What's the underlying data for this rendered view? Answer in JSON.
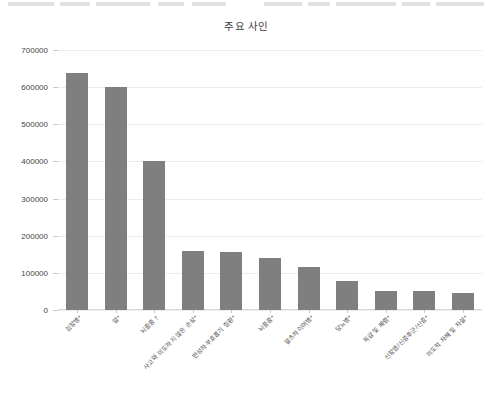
{
  "chart_data": {
    "type": "bar",
    "title": "주요 사인",
    "xlabel": "",
    "ylabel": "",
    "ylim": [
      0,
      700000
    ],
    "ytick_values": [
      0,
      100000,
      200000,
      300000,
      400000,
      500000,
      600000,
      700000
    ],
    "ytick_labels": [
      "0",
      "100000",
      "200000",
      "300000",
      "400000",
      "500000",
      "600000",
      "700000"
    ],
    "grid": true,
    "legend": "none",
    "bar_color": "#7f7f7f",
    "categories": [
      "심장병*",
      "암*",
      "뇌졸중 †",
      "사고와 의도하지 않은 손상*",
      "만성하부호흡기 질환*",
      "뇌졸중*",
      "알츠하이머병*",
      "당뇨병*",
      "독감 및 폐렴*",
      "신장염/신증후군/신증*",
      "의도적 자해 및 자살*"
    ],
    "values": [
      638000,
      600000,
      400000,
      160000,
      155000,
      140000,
      115000,
      79000,
      52000,
      50000,
      45000
    ]
  },
  "figure": {
    "background": "#ffffff",
    "axis_color": "#d8d8d8",
    "grid_color": "#ececec",
    "text_color": "#3d3d3d"
  }
}
